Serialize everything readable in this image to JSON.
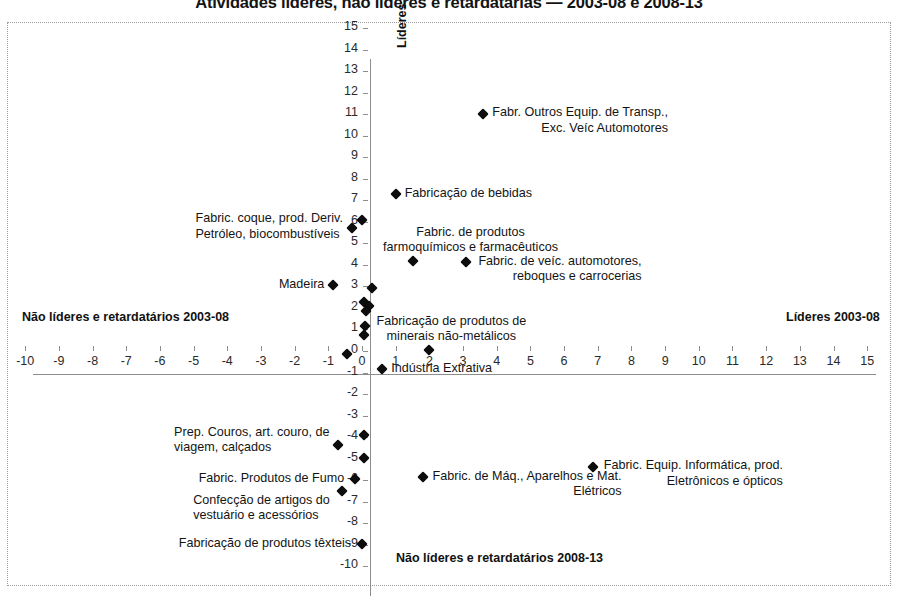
{
  "chart_data": {
    "type": "scatter",
    "title": "Atividades líderes, não líderes e retardatárias — 2003-08 e 2008-13",
    "xlabel": "",
    "ylabel": "",
    "xlim": [
      -10,
      15
    ],
    "ylim": [
      -10,
      15
    ],
    "grid": false,
    "legend": "none",
    "xticks": [
      "-10",
      "-9",
      "-8",
      "-7",
      "-6",
      "-5",
      "-4",
      "-3",
      "-2",
      "-1",
      "0",
      "1",
      "2",
      "3",
      "4",
      "5",
      "6",
      "7",
      "8",
      "9",
      "10",
      "11",
      "12",
      "13",
      "14",
      "15"
    ],
    "yticks": [
      "15",
      "14",
      "13",
      "12",
      "11",
      "10",
      "9",
      "8",
      "7",
      "6",
      "5",
      "4",
      "3",
      "2",
      "1",
      "0",
      "-1",
      "-2",
      "-3",
      "-4",
      "-5",
      "-6",
      "-7",
      "-8",
      "-9",
      "-10"
    ],
    "quadrant_captions": {
      "left": "Não líderes e retardatários 2003-08",
      "right": "Líderes 2003-08",
      "bottom": "Não líderes e retardatários 2008-13",
      "vertical": "Líderes 2008-13"
    },
    "points": [
      {
        "label": "Fabr. Outros Equip. de Transp.,\nExc. Veíc Automotores",
        "x": 3.6,
        "y": 11.0
      },
      {
        "label": "Fabricação de bebidas",
        "x": 1.0,
        "y": 7.3
      },
      {
        "label": "",
        "x": 0.0,
        "y": 6.1
      },
      {
        "label": "Fabric. coque, prod. Deriv.\nPetróleo, biocombustíveis",
        "x": -0.3,
        "y": 5.7
      },
      {
        "label": "Fabric. de produtos\nfarmoquímicos e farmacêuticos",
        "x": 1.5,
        "y": 4.2
      },
      {
        "label": "Fabric. de veíc. automotores,\nreboques e carrocerias",
        "x": 3.1,
        "y": 4.15
      },
      {
        "label": "Madeira",
        "x": -0.85,
        "y": 3.05
      },
      {
        "label": "",
        "x": 0.3,
        "y": 2.95
      },
      {
        "label": "",
        "x": 0.05,
        "y": 2.3
      },
      {
        "label": "",
        "x": 0.2,
        "y": 2.1
      },
      {
        "label": "",
        "x": 0.12,
        "y": 1.85
      },
      {
        "label": "",
        "x": 0.1,
        "y": 1.15
      },
      {
        "label": "",
        "x": 0.05,
        "y": 0.75
      },
      {
        "label": "Fabricação  de  produtos de\nminerais não-metálicos",
        "x": 2.0,
        "y": 0.05
      },
      {
        "label": "",
        "x": -0.45,
        "y": -0.15
      },
      {
        "label": "Indústria Extrativa",
        "x": 0.6,
        "y": -0.85
      },
      {
        "label": "",
        "x": 0.05,
        "y": -3.9
      },
      {
        "label": "Prep. Couros, art. couro, de\nviagem, calçados",
        "x": -0.7,
        "y": -4.35
      },
      {
        "label": "",
        "x": 0.05,
        "y": -4.95
      },
      {
        "label": "Fabric. Equip. Informática, prod.\nEletrônicos e ópticos",
        "x": 6.85,
        "y": -5.4
      },
      {
        "label": "Fabric. de Máq., Aparelhos e Mat.\nElétricos",
        "x": 1.8,
        "y": -5.85
      },
      {
        "label": "Fabric. Produtos de Fumo",
        "x": -0.2,
        "y": -5.95
      },
      {
        "label": "Confecção de artigos do\nvestuário e acessórios",
        "x": -0.6,
        "y": -6.5
      },
      {
        "label": "Fabricação de produtos têxteis",
        "x": 0.0,
        "y": -8.95
      }
    ]
  }
}
